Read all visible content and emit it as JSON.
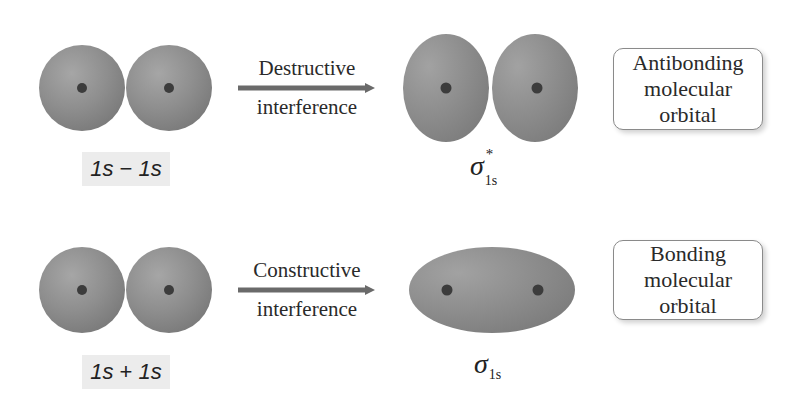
{
  "colors": {
    "orbital_fill": "#8c8c8c",
    "orbital_highlight": "#a8a8a8",
    "orbital_edge": "#6e6e6e",
    "nucleus": "#3c3c3c",
    "arrow": "#6a6a6a",
    "label_bg": "#ececec",
    "box_border": "#8a8a8a"
  },
  "rows": [
    {
      "combination_label": {
        "left": "1s",
        "operator": "−",
        "right": "1s"
      },
      "arrow_text": {
        "line1": "Destructive",
        "line2": "interference"
      },
      "result_symbol": {
        "base": "σ",
        "subscript": "1s",
        "superscript": "*"
      },
      "result_shape": "two-separated-lobes",
      "orbital_type": {
        "line1": "Antibonding",
        "line2": "molecular",
        "line3": "orbital"
      }
    },
    {
      "combination_label": {
        "left": "1s",
        "operator": "+",
        "right": "1s"
      },
      "arrow_text": {
        "line1": "Constructive",
        "line2": "interference"
      },
      "result_symbol": {
        "base": "σ",
        "subscript": "1s",
        "superscript": ""
      },
      "result_shape": "single-elongated-ellipsoid",
      "orbital_type": {
        "line1": "Bonding",
        "line2": "molecular",
        "line3": "orbital"
      }
    }
  ]
}
